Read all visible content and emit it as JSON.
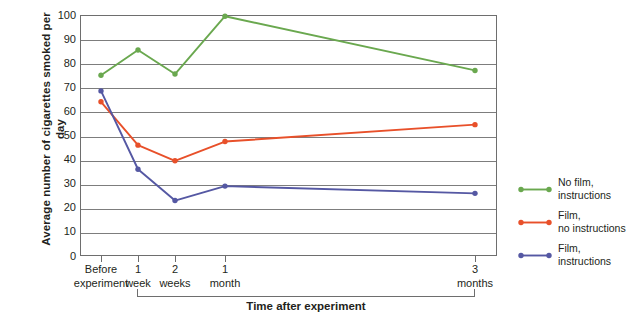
{
  "chart_data": {
    "type": "line",
    "title": "",
    "xlabel": "Time after experiment",
    "ylabel": "Average number of cigarettes\nsmoked per day",
    "categories": [
      "Before\nexperiment",
      "1\nweek",
      "2\nweeks",
      "1\nmonth",
      "3\nmonths"
    ],
    "category_positions": [
      101,
      138,
      175,
      225,
      475
    ],
    "ylim": [
      0,
      100
    ],
    "yticks": [
      0,
      10,
      20,
      30,
      40,
      50,
      60,
      70,
      80,
      90,
      100
    ],
    "ytick_labels": [
      "0",
      "10",
      "20",
      "30",
      "40",
      "50",
      "60",
      "70",
      "80",
      "90",
      "100"
    ],
    "grid": true,
    "legend_position": "right",
    "series": [
      {
        "name": "No film,\ninstructions",
        "color": "#6aa84f",
        "values": [
          75,
          85.5,
          75.5,
          99.5,
          77
        ]
      },
      {
        "name": "Film,\nno instructions",
        "color": "#e8502a",
        "values": [
          64,
          46,
          39.5,
          47.5,
          54.5
        ]
      },
      {
        "name": "Film,\ninstructions",
        "color": "#5558a3",
        "values": [
          68.5,
          36,
          23,
          29,
          26
        ]
      }
    ]
  },
  "axis": {
    "y_title": "Average number of cigarettes smoked per day",
    "x_title": "Time after experiment"
  },
  "colors": {
    "axis": "#6e6e6e",
    "grid": "#7d7d7d",
    "text": "#231f20",
    "background": "#ffffff"
  }
}
